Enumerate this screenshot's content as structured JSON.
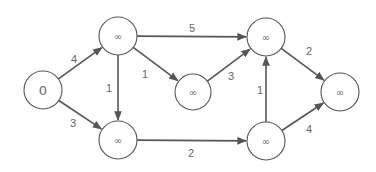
{
  "diagram": {
    "type": "weighted-directed-graph",
    "nodes": [
      {
        "id": "A",
        "label": "0",
        "x": 43,
        "y": 90,
        "r": 19,
        "font": 13
      },
      {
        "id": "B",
        "label": "∞",
        "x": 118,
        "y": 36,
        "r": 19,
        "font": 10
      },
      {
        "id": "C",
        "label": "∞",
        "x": 118,
        "y": 140,
        "r": 19,
        "font": 10
      },
      {
        "id": "D",
        "label": "∞",
        "x": 193,
        "y": 92,
        "r": 18,
        "font": 10
      },
      {
        "id": "E",
        "label": "∞",
        "x": 266,
        "y": 37,
        "r": 19,
        "font": 10
      },
      {
        "id": "F",
        "label": "∞",
        "x": 266,
        "y": 141,
        "r": 19,
        "font": 10
      },
      {
        "id": "G",
        "label": "∞",
        "x": 340,
        "y": 92,
        "r": 19,
        "font": 10
      }
    ],
    "edges": [
      {
        "from": "A",
        "to": "B",
        "weight": "4",
        "lx": 74,
        "ly": 59
      },
      {
        "from": "A",
        "to": "C",
        "weight": "3",
        "lx": 73,
        "ly": 123
      },
      {
        "from": "B",
        "to": "C",
        "weight": "1",
        "lx": 109,
        "ly": 88
      },
      {
        "from": "B",
        "to": "D",
        "weight": "1",
        "lx": 145,
        "ly": 74
      },
      {
        "from": "B",
        "to": "E",
        "weight": "5",
        "lx": 192,
        "ly": 28
      },
      {
        "from": "D",
        "to": "E",
        "weight": "3",
        "lx": 231,
        "ly": 76
      },
      {
        "from": "C",
        "to": "F",
        "weight": "2",
        "lx": 191,
        "ly": 153
      },
      {
        "from": "F",
        "to": "E",
        "weight": "1",
        "lx": 260,
        "ly": 90
      },
      {
        "from": "E",
        "to": "G",
        "weight": "2",
        "lx": 309,
        "ly": 51
      },
      {
        "from": "F",
        "to": "G",
        "weight": "4",
        "lx": 309,
        "ly": 129
      }
    ],
    "colors": {
      "stroke": "#555555",
      "text": "#666666",
      "background": "#ffffff"
    }
  }
}
